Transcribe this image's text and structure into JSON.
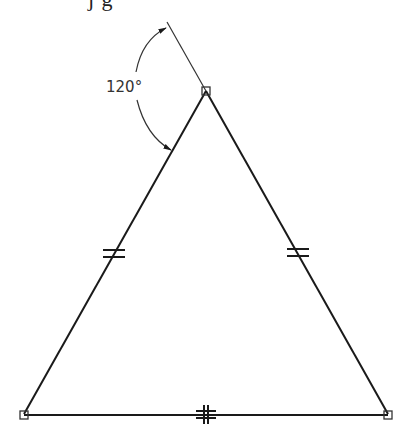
{
  "caption_cut": "j  g",
  "diagram": {
    "angle_label": "120°",
    "colors": {
      "line": "#1a1a1a",
      "background": "#ffffff",
      "dimension": "#333333"
    },
    "vertices": {
      "apex": {
        "x": 206,
        "y": 91
      },
      "bottom_left": {
        "x": 24,
        "y": 414
      },
      "bottom_right": {
        "x": 388,
        "y": 414
      }
    },
    "constraints": {
      "left_side_ticks": "double",
      "right_side_ticks": "double",
      "bottom_side_ticks": "double-crossed"
    },
    "extension_line": {
      "from": {
        "x": 206,
        "y": 91
      },
      "to": {
        "x": 167,
        "y": 22
      }
    }
  }
}
